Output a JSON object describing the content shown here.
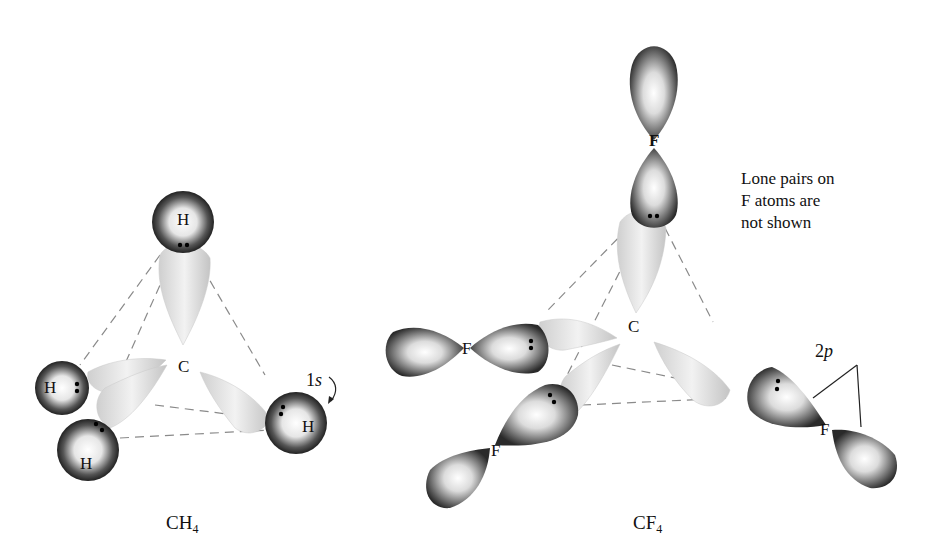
{
  "figure": {
    "left": {
      "molecule_caption": "CH",
      "caption_subscript": "4",
      "central_atom": "C",
      "outer_atoms": [
        "H",
        "H",
        "H",
        "H"
      ],
      "orbital_label_prefix": "1",
      "orbital_label_letter": "s"
    },
    "right": {
      "molecule_caption": "CF",
      "caption_subscript": "4",
      "central_atom": "C",
      "outer_atoms": [
        "F",
        "F",
        "F",
        "F"
      ],
      "orbital_label_prefix": "2",
      "orbital_label_letter": "p",
      "note_lines": [
        "Lone pairs on",
        "F atoms are",
        "not shown"
      ]
    }
  },
  "colors": {
    "hybrid_lobe": "#d9d9d9",
    "atomic_orbital_dark": "#3a3a3a",
    "dashed_line": "#888888",
    "text": "#111111"
  }
}
